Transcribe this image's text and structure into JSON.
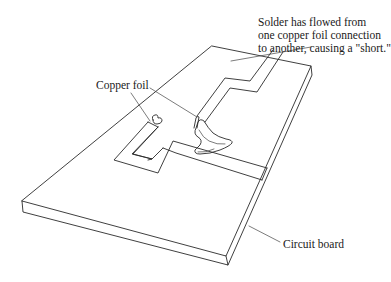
{
  "figure": {
    "type": "diagram"
  },
  "labels": {
    "short_note": {
      "lines": [
        "Solder has flowed from",
        "one copper foil connection",
        "to another, causing a \"short.\""
      ]
    },
    "copper_foil": "Copper foil",
    "circuit_board": "Circuit board"
  },
  "colors": {
    "line": "#2a2a2a",
    "background": "#ffffff"
  }
}
